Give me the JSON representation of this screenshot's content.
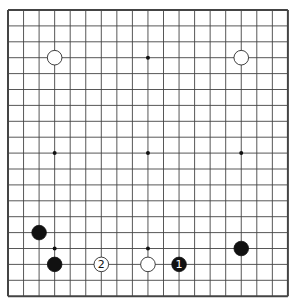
{
  "board": {
    "size": 19,
    "x0": 8,
    "y0": 10,
    "dx": 15.55,
    "dy": 15.9
  },
  "hoshi": [
    [
      3,
      3
    ],
    [
      9,
      3
    ],
    [
      15,
      3
    ],
    [
      3,
      9
    ],
    [
      9,
      9
    ],
    [
      15,
      9
    ],
    [
      3,
      15
    ],
    [
      9,
      15
    ],
    [
      15,
      15
    ]
  ],
  "stones": [
    {
      "color": "white",
      "col": 3,
      "row": 3,
      "label": ""
    },
    {
      "color": "white",
      "col": 15,
      "row": 3,
      "label": ""
    },
    {
      "color": "black",
      "col": 2,
      "row": 14,
      "label": ""
    },
    {
      "color": "black",
      "col": 3,
      "row": 16,
      "label": ""
    },
    {
      "color": "white",
      "col": 6,
      "row": 16,
      "label": "2"
    },
    {
      "color": "white",
      "col": 9,
      "row": 16,
      "label": ""
    },
    {
      "color": "black",
      "col": 11,
      "row": 16,
      "label": "1"
    },
    {
      "color": "black",
      "col": 15,
      "row": 15,
      "label": ""
    }
  ]
}
